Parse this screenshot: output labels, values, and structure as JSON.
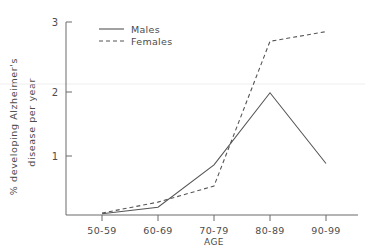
{
  "chart_data": {
    "type": "line",
    "title": "",
    "xlabel": "AGE",
    "ylabel": "% developing Alzheimer's disease per year",
    "ylabel_line1": "% developing Alzheimer's",
    "ylabel_line2": "disease per year",
    "categories": [
      "50-59",
      "60-69",
      "70-79",
      "80-89",
      "90-99"
    ],
    "series": [
      {
        "name": "Males",
        "style": "solid",
        "values": [
          0.02,
          0.12,
          0.78,
          1.9,
          0.8
        ]
      },
      {
        "name": "Females",
        "style": "dashed",
        "values": [
          0.03,
          0.2,
          0.45,
          2.7,
          2.85
        ]
      }
    ],
    "ylim": [
      0,
      3
    ],
    "yticks": [
      "1",
      "2",
      "3"
    ],
    "ytick_values": [
      1,
      2,
      3
    ],
    "grid": false,
    "legend_position": "top-left-inside"
  },
  "legend": {
    "entries": [
      {
        "label": "Males",
        "style": "solid"
      },
      {
        "label": "Females",
        "style": "dashed"
      }
    ]
  },
  "axes": {
    "y_ticks": [
      {
        "label": "3",
        "value": 3
      },
      {
        "label": "2",
        "value": 2
      },
      {
        "label": "1",
        "value": 1
      }
    ],
    "x_ticks": [
      {
        "label": "50-59"
      },
      {
        "label": "60-69"
      },
      {
        "label": "70-79"
      },
      {
        "label": "80-89"
      },
      {
        "label": "90-99"
      }
    ],
    "x_axis_name": "AGE",
    "y_axis_name_line1": "% developing Alzheimer's",
    "y_axis_name_line2": "disease per year"
  }
}
